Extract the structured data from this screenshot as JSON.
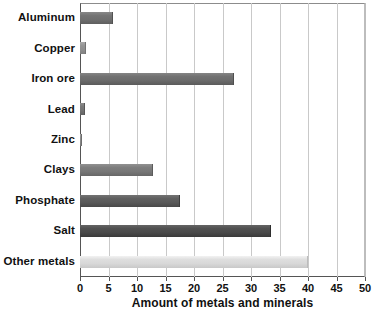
{
  "chart_data": {
    "type": "bar",
    "orientation": "horizontal",
    "title": "",
    "xlabel": "Amount of metals and minerals",
    "ylabel": "",
    "xlim": [
      0,
      50
    ],
    "xticks": [
      0,
      5,
      10,
      15,
      20,
      25,
      30,
      35,
      40,
      45,
      50
    ],
    "grid": "vertical",
    "legend": "none",
    "categories": [
      "Aluminum",
      "Copper",
      "Iron ore",
      "Lead",
      "Zinc",
      "Clays",
      "Phosphate",
      "Salt",
      "Other metals"
    ],
    "values": [
      5.8,
      1.0,
      27.0,
      0.9,
      0.4,
      12.8,
      17.5,
      33.5,
      40.0
    ],
    "bar_colors": [
      "#6e6e6e",
      "#8f8f8f",
      "#6b6b6b",
      "#737373",
      "#8a8a8a",
      "#777777",
      "#595959",
      "#4a4a4a",
      "#d8d8d8"
    ]
  },
  "axis": {
    "x_title": "Amount of metals and minerals",
    "tick_labels": [
      "0",
      "5",
      "10",
      "15",
      "20",
      "25",
      "30",
      "35",
      "40",
      "45",
      "50"
    ]
  }
}
